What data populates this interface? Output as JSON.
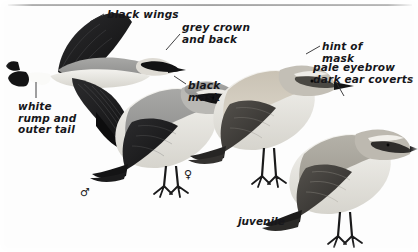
{
  "plate": {
    "width": 418,
    "height": 252,
    "background": "#fdfdfd",
    "subject": "Northern Wheatear",
    "rule_color": "#8e8e8e"
  },
  "annotations": [
    {
      "id": "black-wings",
      "text": "black wings",
      "x": 107,
      "y": 9,
      "align": "left"
    },
    {
      "id": "grey-crown-back",
      "text": "grey crown\nand back",
      "x": 182,
      "y": 22,
      "align": "left"
    },
    {
      "id": "black-mask",
      "text": "black\nmask",
      "x": 188,
      "y": 80,
      "align": "left"
    },
    {
      "id": "hint-of-mask",
      "text": "hint of\nmask",
      "x": 322,
      "y": 41,
      "align": "left"
    },
    {
      "id": "pale-eyebrow",
      "text": "pale eyebrow\ndark ear coverts",
      "x": 313,
      "y": 62,
      "align": "left"
    },
    {
      "id": "white-rump-tail",
      "text": "white\nrump and\nouter tail",
      "x": 18,
      "y": 101,
      "align": "left"
    }
  ],
  "figures": [
    {
      "id": "flight",
      "caption": "",
      "caption_x": 0,
      "caption_y": 0
    },
    {
      "id": "male",
      "caption": "♂",
      "caption_x": 80,
      "caption_y": 186
    },
    {
      "id": "female",
      "caption": "♀",
      "caption_x": 184,
      "caption_y": 168
    },
    {
      "id": "juvenile",
      "caption": "juvenile",
      "caption_x": 238,
      "caption_y": 215
    }
  ],
  "captions": {
    "male_symbol": "♂",
    "female_symbol": "♀",
    "juvenile_label": "juvenile"
  },
  "palette": {
    "black": "#141414",
    "dark_grey": "#3a3a3c",
    "mid_grey": "#8d8d90",
    "light_grey": "#c6c6c4",
    "pale": "#e9e7e2",
    "buff": "#d8d2c6",
    "white": "#fbfbfa",
    "ink": "#16161a"
  }
}
